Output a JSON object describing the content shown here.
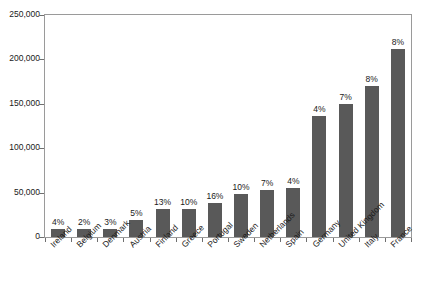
{
  "chart_data": {
    "type": "bar",
    "title": "",
    "subtitle": "",
    "xlabel": "",
    "ylabel": "",
    "ylim": [
      0,
      250000
    ],
    "grid": false,
    "legend": null,
    "bar_color": "#595959",
    "axis_color": "#9a9a9a",
    "categories": [
      "Ireland",
      "Belgium",
      "Denmark",
      "Austria",
      "Finland",
      "Greece",
      "Portugal",
      "Sweden",
      "Netherlands",
      "Spain",
      "Germany",
      "United Kingdom",
      "Italy",
      "France"
    ],
    "values": [
      9000,
      9500,
      9500,
      19000,
      31000,
      32000,
      38000,
      48000,
      53000,
      55000,
      136000,
      150000,
      170000,
      212000
    ],
    "data_labels": [
      "4%",
      "2%",
      "3%",
      "5%",
      "13%",
      "10%",
      "16%",
      "10%",
      "7%",
      "4%",
      "4%",
      "7%",
      "8%",
      "8%"
    ],
    "yticks": [
      0,
      50000,
      100000,
      150000,
      200000,
      250000
    ],
    "ytick_labels": [
      "0",
      "50,000",
      "100,000",
      "150,000",
      "200,000",
      "250,000"
    ]
  }
}
